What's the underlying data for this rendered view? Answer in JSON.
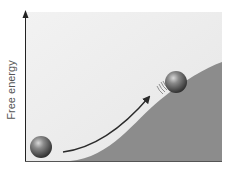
{
  "figure": {
    "top_partial_label": "(   )",
    "y_axis_label": "Free energy",
    "colors": {
      "background": "#efefef",
      "hill": "#8c8c8c",
      "axis": "#222222",
      "ball_light": "#b0b0b0",
      "ball_dark": "#3a3a3a",
      "arrow": "#2b2b2b"
    },
    "elements": [
      {
        "name": "ball-low-energy",
        "position": "bottom-left valley"
      },
      {
        "name": "ball-high-energy",
        "position": "on hill slope"
      },
      {
        "name": "arrow",
        "from": "ball-low-energy",
        "to": "ball-high-energy"
      }
    ]
  }
}
